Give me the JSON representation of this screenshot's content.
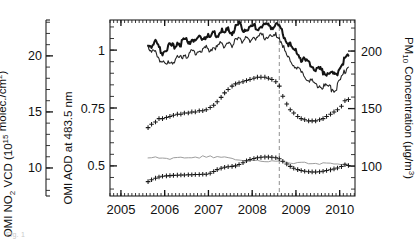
{
  "figure": {
    "caption_fragment": "Fig. 1",
    "event_marker_label": "",
    "frame": {
      "left": 110,
      "right": 355,
      "top": 20,
      "bottom": 196
    }
  },
  "axes": {
    "left_outer": {
      "title_parts": [
        "OMI NO",
        "2",
        " VCD (10",
        "15",
        " molec./cm",
        "2",
        ")"
      ],
      "title_plain": "OMI NO2 VCD (10^15 molec./cm2)",
      "ticks": [
        "10",
        "15",
        "20"
      ],
      "tick_values": [
        10,
        15,
        20
      ],
      "range": [
        7.5,
        23.2
      ]
    },
    "left_inner": {
      "title_plain": "OMI AOD at 483.5 nm",
      "ticks": [
        "0.5",
        "0.75",
        "1"
      ],
      "tick_values": [
        0.5,
        0.75,
        1
      ],
      "range": [
        0.37,
        1.13
      ]
    },
    "right": {
      "title_parts": [
        "PM",
        "10",
        " Concentration (",
        "µg/m",
        "3",
        ")"
      ],
      "title_plain": "PM10 Concentration (µg/m3)",
      "ticks": [
        "100",
        "150",
        "200"
      ],
      "tick_values": [
        100,
        150,
        200
      ],
      "range": [
        74,
        227
      ]
    },
    "x": {
      "ticks": [
        "2005",
        "2006",
        "2007",
        "2008",
        "2009",
        "2010"
      ],
      "tick_values": [
        2005,
        2006,
        2007,
        2008,
        2009,
        2010
      ],
      "range": [
        2004.75,
        2010.35
      ],
      "minor_tick_interval_years": 0.0833
    }
  },
  "chart_data": {
    "type": "line",
    "title": "",
    "xlabel": "",
    "ylabel": "",
    "grid": false,
    "legend": "none",
    "xlim": [
      2004.75,
      2010.35
    ],
    "annotations": [
      {
        "type": "vline",
        "x": 2008.62,
        "style": "dashed",
        "color": "#9a9a9a",
        "label": "Beijing Olympics"
      }
    ],
    "series": [
      {
        "name": "PM10 concentration (thick black line)",
        "axis": "right",
        "style": "line-thick",
        "color": "#141414",
        "unit": "µg/m3",
        "x": [
          2005.62,
          2005.7,
          2005.79,
          2005.87,
          2005.95,
          2006.04,
          2006.12,
          2006.2,
          2006.29,
          2006.37,
          2006.45,
          2006.54,
          2006.62,
          2006.7,
          2006.79,
          2006.87,
          2006.95,
          2007.04,
          2007.12,
          2007.2,
          2007.29,
          2007.37,
          2007.45,
          2007.54,
          2007.62,
          2007.7,
          2007.79,
          2007.87,
          2007.95,
          2008.04,
          2008.12,
          2008.2,
          2008.29,
          2008.37,
          2008.45,
          2008.54,
          2008.62,
          2008.7,
          2008.79,
          2008.87,
          2008.95,
          2009.04,
          2009.12,
          2009.2,
          2009.29,
          2009.37,
          2009.45,
          2009.54,
          2009.62,
          2009.7,
          2009.79,
          2009.87,
          2009.95,
          2010.04,
          2010.12,
          2010.2
        ],
        "values": [
          206,
          203,
          208,
          200,
          197,
          201,
          204,
          202,
          206,
          205,
          208,
          206,
          209,
          207,
          210,
          209,
          212,
          210,
          214,
          212,
          216,
          214,
          217,
          215,
          219,
          222,
          216,
          219,
          217,
          221,
          218,
          221,
          219,
          222,
          220,
          221,
          220,
          214,
          206,
          203,
          199,
          196,
          192,
          190,
          187,
          185,
          183,
          182,
          181,
          180,
          179,
          178,
          180,
          186,
          192,
          196
        ]
      },
      {
        "name": "PM10 related thin black line",
        "axis": "right",
        "style": "line-thin",
        "color": "#252525",
        "unit": "µg/m3",
        "x": [
          2005.62,
          2005.7,
          2005.79,
          2005.87,
          2005.95,
          2006.04,
          2006.12,
          2006.2,
          2006.29,
          2006.37,
          2006.45,
          2006.54,
          2006.62,
          2006.7,
          2006.79,
          2006.87,
          2006.95,
          2007.04,
          2007.12,
          2007.2,
          2007.29,
          2007.37,
          2007.45,
          2007.54,
          2007.62,
          2007.7,
          2007.79,
          2007.87,
          2007.95,
          2008.04,
          2008.12,
          2008.2,
          2008.29,
          2008.37,
          2008.45,
          2008.54,
          2008.62,
          2008.7,
          2008.79,
          2008.87,
          2008.95,
          2009.04,
          2009.12,
          2009.2,
          2009.29,
          2009.37,
          2009.45,
          2009.54,
          2009.62,
          2009.7,
          2009.79,
          2009.87,
          2009.95,
          2010.04,
          2010.12,
          2010.2
        ],
        "values": [
          200,
          196,
          199,
          192,
          188,
          186,
          191,
          189,
          193,
          192,
          196,
          194,
          198,
          196,
          200,
          198,
          201,
          200,
          203,
          201,
          205,
          203,
          207,
          200,
          209,
          212,
          206,
          210,
          208,
          212,
          209,
          212,
          210,
          213,
          211,
          212,
          211,
          203,
          194,
          190,
          186,
          183,
          179,
          177,
          174,
          172,
          170,
          169,
          168,
          167,
          166,
          165,
          168,
          175,
          181,
          186
        ]
      },
      {
        "name": "OMI NO2 VCD (plus markers, upper)",
        "axis": "left_outer",
        "style": "markers-plus",
        "color": "#1a1a1a",
        "unit": "10^15 molec./cm2",
        "x": [
          2005.62,
          2005.7,
          2005.79,
          2005.87,
          2005.95,
          2006.04,
          2006.12,
          2006.2,
          2006.29,
          2006.37,
          2006.45,
          2006.54,
          2006.62,
          2006.7,
          2006.79,
          2006.87,
          2006.95,
          2007.04,
          2007.12,
          2007.2,
          2007.29,
          2007.37,
          2007.45,
          2007.54,
          2007.62,
          2007.7,
          2007.79,
          2007.87,
          2007.95,
          2008.04,
          2008.12,
          2008.2,
          2008.29,
          2008.37,
          2008.45,
          2008.54,
          2008.62,
          2008.7,
          2008.79,
          2008.87,
          2008.95,
          2009.04,
          2009.12,
          2009.2,
          2009.29,
          2009.37,
          2009.45,
          2009.54,
          2009.62,
          2009.7,
          2009.79,
          2009.87,
          2009.95,
          2010.04,
          2010.12,
          2010.2
        ],
        "values": [
          13.6,
          13.9,
          14.1,
          14.4,
          14.4,
          14.5,
          14.6,
          14.7,
          14.8,
          14.8,
          14.9,
          14.9,
          15.0,
          15.0,
          15.1,
          15.1,
          15.2,
          15.4,
          15.6,
          15.9,
          16.3,
          16.7,
          17.0,
          17.3,
          17.5,
          17.6,
          17.7,
          17.8,
          17.9,
          18.0,
          18.1,
          18.1,
          18.1,
          18.0,
          17.9,
          17.7,
          17.3,
          16.4,
          15.7,
          15.2,
          14.9,
          14.6,
          14.4,
          14.3,
          14.2,
          14.2,
          14.2,
          14.3,
          14.4,
          14.6,
          14.8,
          15.0,
          15.2,
          15.5,
          16.0,
          16.1
        ]
      },
      {
        "name": "OMI AOD at 483.5 nm (gray line)",
        "axis": "left_inner",
        "style": "line-gray",
        "color": "#9d9d9d",
        "unit": "",
        "x": [
          2005.62,
          2005.7,
          2005.79,
          2005.87,
          2005.95,
          2006.04,
          2006.12,
          2006.2,
          2006.29,
          2006.37,
          2006.45,
          2006.54,
          2006.62,
          2006.7,
          2006.79,
          2006.87,
          2006.95,
          2007.04,
          2007.12,
          2007.2,
          2007.29,
          2007.37,
          2007.45,
          2007.54,
          2007.62,
          2007.7,
          2007.79,
          2007.87,
          2007.95,
          2008.04,
          2008.12,
          2008.2,
          2008.29,
          2008.37,
          2008.45,
          2008.54,
          2008.62,
          2008.7,
          2008.79,
          2008.87,
          2008.95,
          2009.04,
          2009.12,
          2009.2,
          2009.29,
          2009.37,
          2009.45,
          2009.54,
          2009.62,
          2009.7,
          2009.79,
          2009.87,
          2009.95,
          2010.04,
          2010.12,
          2010.2
        ],
        "values": [
          0.533,
          0.53,
          0.534,
          0.531,
          0.529,
          0.533,
          0.53,
          0.534,
          0.531,
          0.535,
          0.532,
          0.536,
          0.533,
          0.537,
          0.534,
          0.538,
          0.535,
          0.539,
          0.536,
          0.54,
          0.537,
          0.534,
          0.531,
          0.528,
          0.526,
          0.524,
          0.522,
          0.521,
          0.52,
          0.519,
          0.518,
          0.518,
          0.517,
          0.517,
          0.516,
          0.516,
          0.515,
          0.514,
          0.513,
          0.512,
          0.511,
          0.511,
          0.51,
          0.51,
          0.509,
          0.509,
          0.509,
          0.508,
          0.508,
          0.508,
          0.507,
          0.507,
          0.507,
          0.506,
          0.506,
          0.506
        ]
      },
      {
        "name": "AOD plus-marker series (lower)",
        "axis": "left_inner",
        "style": "markers-plus",
        "color": "#1a1a1a",
        "unit": "",
        "x": [
          2005.62,
          2005.7,
          2005.79,
          2005.87,
          2005.95,
          2006.04,
          2006.12,
          2006.2,
          2006.29,
          2006.37,
          2006.45,
          2006.54,
          2006.62,
          2006.7,
          2006.79,
          2006.87,
          2006.95,
          2007.04,
          2007.12,
          2007.2,
          2007.29,
          2007.37,
          2007.45,
          2007.54,
          2007.62,
          2007.7,
          2007.79,
          2007.87,
          2007.95,
          2008.04,
          2008.12,
          2008.2,
          2008.29,
          2008.37,
          2008.45,
          2008.54,
          2008.62,
          2008.7,
          2008.79,
          2008.87,
          2008.95,
          2009.04,
          2009.12,
          2009.2,
          2009.29,
          2009.37,
          2009.45,
          2009.54,
          2009.62,
          2009.7,
          2009.79,
          2009.87,
          2009.95,
          2010.04,
          2010.12,
          2010.2
        ],
        "values": [
          0.432,
          0.44,
          0.447,
          0.452,
          0.455,
          0.457,
          0.458,
          0.459,
          0.46,
          0.461,
          0.461,
          0.462,
          0.462,
          0.463,
          0.463,
          0.464,
          0.464,
          0.468,
          0.476,
          0.484,
          0.49,
          0.494,
          0.496,
          0.498,
          0.5,
          0.506,
          0.514,
          0.522,
          0.528,
          0.532,
          0.535,
          0.537,
          0.538,
          0.538,
          0.537,
          0.535,
          0.531,
          0.52,
          0.508,
          0.498,
          0.49,
          0.484,
          0.48,
          0.477,
          0.475,
          0.474,
          0.474,
          0.475,
          0.477,
          0.48,
          0.483,
          0.487,
          0.491,
          0.497,
          0.505,
          0.502
        ]
      }
    ]
  }
}
